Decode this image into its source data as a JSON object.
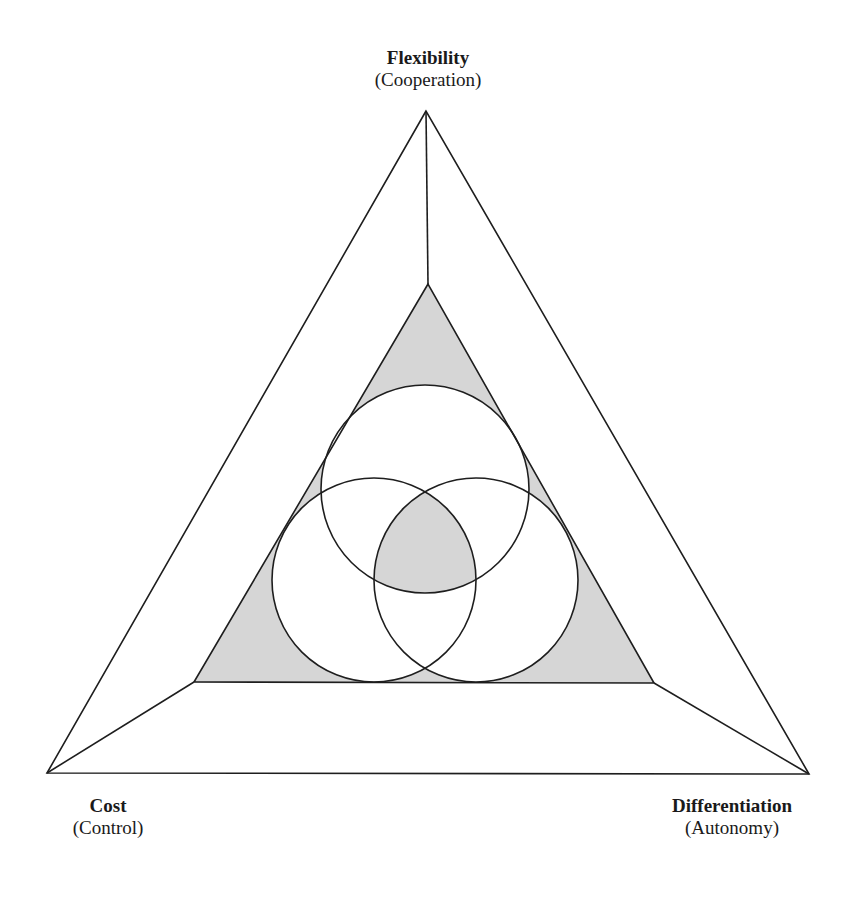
{
  "diagram": {
    "type": "triangle-venn",
    "colors": {
      "stroke": "#1e1e1e",
      "shaded": "#d6d6d6",
      "background": "#ffffff"
    },
    "outer_triangle": {
      "top": [
        426,
        111
      ],
      "bottom_left": [
        47,
        773
      ],
      "bottom_right": [
        809,
        774
      ]
    },
    "inner_triangle": {
      "top": [
        428,
        284
      ],
      "bottom_left": [
        194,
        682
      ],
      "bottom_right": [
        654,
        683
      ],
      "fill": "shaded"
    },
    "circles": [
      {
        "name": "top",
        "cx": 425,
        "cy": 489,
        "r": 104
      },
      {
        "name": "left",
        "cx": 374,
        "cy": 580,
        "r": 102
      },
      {
        "name": "right",
        "cx": 476,
        "cy": 580,
        "r": 102
      }
    ],
    "shaded_regions": [
      "inner-triangle-outside-circles",
      "triple-overlap-center"
    ]
  },
  "labels": {
    "top": {
      "title": "Flexibility",
      "subtitle": "(Cooperation)"
    },
    "bottom_left": {
      "title": "Cost",
      "subtitle": "(Control)"
    },
    "bottom_right": {
      "title": "Differentiation",
      "subtitle": "(Autonomy)"
    }
  }
}
